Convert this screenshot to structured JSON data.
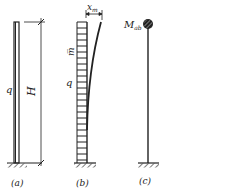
{
  "figure": {
    "panels": [
      {
        "id": "a",
        "caption": "(a)",
        "load_label": "q",
        "dimension_label": "H"
      },
      {
        "id": "b",
        "caption": "(b)",
        "mass_label": "m̅",
        "load_label": "q",
        "deflection_label": "x",
        "deflection_sub": "m"
      },
      {
        "id": "c",
        "caption": "(c)",
        "mass_label": "M",
        "mass_sub": "ab"
      }
    ],
    "colors": {
      "stroke": "#222222",
      "background": "#ffffff"
    }
  }
}
